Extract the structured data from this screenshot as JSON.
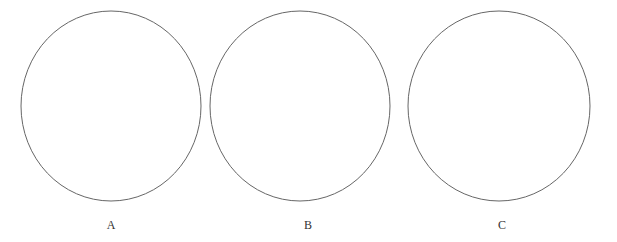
{
  "figure": {
    "background_color": "#ffffff",
    "width": 617,
    "height": 242,
    "stroke_color": "#666666",
    "stroke_width": 1,
    "label_color": "#333333",
    "label_font_size": 12,
    "shapes": [
      {
        "label": "A",
        "kind": "circle-outline",
        "cx": 111,
        "cy": 106,
        "rx": 90,
        "ry": 95,
        "label_x": 111,
        "label_y": 219
      },
      {
        "label": "B",
        "kind": "circle-outline",
        "cx": 300,
        "cy": 106,
        "rx": 90,
        "ry": 95,
        "label_x": 308,
        "label_y": 219
      },
      {
        "label": "C",
        "kind": "circle-outline",
        "cx": 499,
        "cy": 106,
        "rx": 91,
        "ry": 95,
        "label_x": 502,
        "label_y": 219
      }
    ]
  }
}
